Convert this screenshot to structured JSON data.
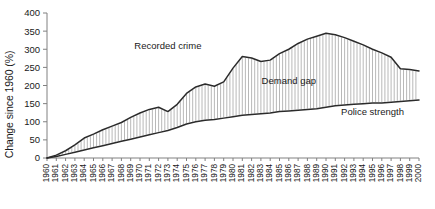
{
  "chart_data": {
    "type": "area",
    "title": "",
    "xlabel": "",
    "ylabel": "Change since 1960 (%)",
    "ylim": [
      0,
      400
    ],
    "yticks": [
      0,
      50,
      100,
      150,
      200,
      250,
      300,
      350,
      400
    ],
    "grid": false,
    "legend_position": "inline-annotations",
    "categories": [
      "1960",
      "1961",
      "1962",
      "1963",
      "1964",
      "1965",
      "1966",
      "1967",
      "1968",
      "1969",
      "1970",
      "1971",
      "1972",
      "1973",
      "1974",
      "1975",
      "1976",
      "1977",
      "1978",
      "1979",
      "1980",
      "1981",
      "1982",
      "1983",
      "1984",
      "1985",
      "1986",
      "1987",
      "1988",
      "1989",
      "1990",
      "1991",
      "1992",
      "1993",
      "1994",
      "1995",
      "1996",
      "1997",
      "1998",
      "1999",
      "2000"
    ],
    "series": [
      {
        "name": "Recorded crime",
        "values": [
          0,
          8,
          20,
          36,
          55,
          66,
          78,
          88,
          98,
          112,
          124,
          134,
          140,
          128,
          148,
          178,
          196,
          204,
          198,
          210,
          248,
          280,
          276,
          266,
          270,
          288,
          300,
          316,
          328,
          336,
          344,
          340,
          332,
          322,
          312,
          300,
          290,
          278,
          246,
          244,
          240
        ]
      },
      {
        "name": "Police strength",
        "values": [
          0,
          4,
          10,
          16,
          22,
          28,
          34,
          40,
          46,
          52,
          58,
          64,
          70,
          76,
          84,
          94,
          100,
          104,
          106,
          110,
          114,
          118,
          120,
          122,
          124,
          128,
          130,
          132,
          134,
          136,
          140,
          144,
          146,
          148,
          150,
          152,
          152,
          154,
          156,
          158,
          160
        ]
      }
    ],
    "annotations": [
      {
        "label": "Recorded crime",
        "x_year": "1973",
        "y_value": 300
      },
      {
        "label": "Demand gap",
        "x_year": "1986",
        "y_value": 205
      },
      {
        "label": "Police strength",
        "x_year": "1995",
        "y_value": 118
      }
    ]
  }
}
